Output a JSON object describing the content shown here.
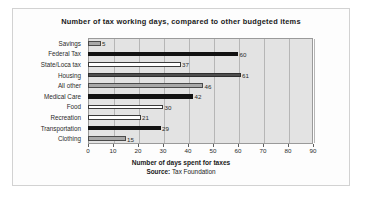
{
  "chart_data": {
    "type": "bar",
    "orientation": "horizontal",
    "title": "Number of tax working days, compared to other budgeted items",
    "xlabel": "Number of days spent for taxes",
    "ylabel": "",
    "source_label": "Source:",
    "source_value": " Tax Foundation",
    "xlim": [
      0,
      90
    ],
    "xticks": [
      0,
      10,
      20,
      30,
      40,
      50,
      60,
      70,
      80,
      90
    ],
    "grid": true,
    "legend": "none",
    "categories": [
      "Savings",
      "Federal Tax",
      "State/Loca tax",
      "Housing",
      "All other",
      "Medical Care",
      "Food",
      "Recreation",
      "Transportation",
      "Clothing"
    ],
    "values": [
      5,
      60,
      37,
      61,
      46,
      42,
      30,
      21,
      29,
      15
    ],
    "bar_fills": [
      "gray",
      "black",
      "white",
      "dark",
      "gray",
      "black",
      "white",
      "white",
      "black",
      "gray"
    ],
    "colors": {
      "black": "#121212",
      "dark": "#4e4e4e",
      "gray": "#a8a8a8",
      "white": "#ffffff",
      "plot_background": "#e3e3e3",
      "gridline": "#b6b6b6",
      "axis": "#9a9a9a",
      "text": "#2b2b2b"
    }
  }
}
